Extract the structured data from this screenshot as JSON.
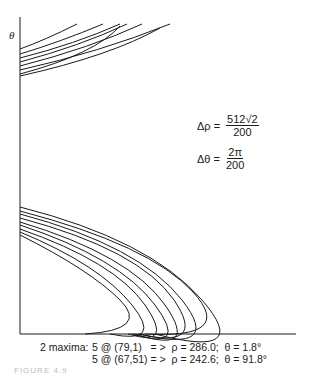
{
  "chart_data": {
    "type": "line",
    "title": "",
    "xlabel": "ρ",
    "ylabel": "θ",
    "equations": [
      {
        "lhs": "Δρ =",
        "num": "512√2",
        "den": "200"
      },
      {
        "lhs": "Δθ =",
        "num": "2π",
        "den": "200"
      }
    ],
    "maxima_label": "2 maxima:",
    "maxima": [
      {
        "text": "5 @ (79,1)   = >  ρ = 286.0;  θ = 1.8°",
        "count": 5,
        "cell": [
          79,
          1
        ],
        "rho": 286.0,
        "theta_deg": 1.8
      },
      {
        "text": "5 @ (67,51) = >  ρ = 242.6;  θ = 91.8°",
        "count": 5,
        "cell": [
          67,
          51
        ],
        "rho": 242.6,
        "theta_deg": 91.8
      }
    ],
    "axes": {
      "origin": [
        20,
        334
      ],
      "y_top": 17,
      "x_right": 296
    },
    "upper_curves": [
      [
        [
          20,
          49
        ],
        [
          45,
          40
        ],
        [
          77,
          24
        ]
      ],
      [
        [
          20,
          54
        ],
        [
          60,
          42
        ],
        [
          103,
          24
        ]
      ],
      [
        [
          20,
          58
        ],
        [
          75,
          44
        ],
        [
          120,
          24
        ]
      ],
      [
        [
          20,
          62
        ],
        [
          80,
          46
        ],
        [
          127,
          24
        ]
      ],
      [
        [
          20,
          66
        ],
        [
          90,
          48
        ],
        [
          142,
          24
        ]
      ],
      [
        [
          20,
          70
        ],
        [
          100,
          52
        ],
        [
          170,
          24
        ]
      ],
      [
        [
          20,
          74
        ],
        [
          95,
          54
        ],
        [
          120,
          26
        ]
      ],
      [
        [
          20,
          76
        ],
        [
          110,
          56
        ],
        [
          160,
          28
        ]
      ]
    ],
    "lower_curves": [
      [
        [
          20,
          207
        ],
        [
          150,
          240
        ],
        [
          202,
          300
        ],
        [
          155,
          334
        ]
      ],
      [
        [
          20,
          211
        ],
        [
          150,
          245
        ],
        [
          193,
          292
        ],
        [
          145,
          334
        ]
      ],
      [
        [
          20,
          214
        ],
        [
          140,
          246
        ],
        [
          182,
          300
        ],
        [
          140,
          334
        ]
      ],
      [
        [
          20,
          218
        ],
        [
          140,
          250
        ],
        [
          174,
          300
        ],
        [
          138,
          334
        ]
      ],
      [
        [
          20,
          222
        ],
        [
          130,
          255
        ],
        [
          165,
          305
        ],
        [
          135,
          334
        ]
      ],
      [
        [
          20,
          225
        ],
        [
          120,
          258
        ],
        [
          155,
          305
        ],
        [
          132,
          334
        ]
      ],
      [
        [
          20,
          229
        ],
        [
          115,
          262
        ],
        [
          145,
          305
        ],
        [
          128,
          334
        ]
      ],
      [
        [
          20,
          232
        ],
        [
          100,
          265
        ],
        [
          132,
          305
        ],
        [
          110,
          334
        ]
      ],
      [
        [
          20,
          235
        ],
        [
          90,
          270
        ],
        [
          120,
          300
        ],
        [
          85,
          334
        ]
      ]
    ]
  },
  "footer_text": "FIGURE 4.9"
}
